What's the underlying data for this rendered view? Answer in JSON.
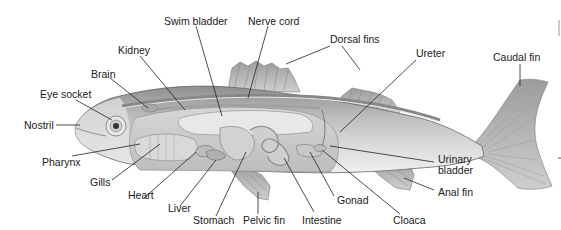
{
  "diagram": {
    "labels": {
      "swim_bladder": "Swim bladder",
      "nerve_cord": "Nerve cord",
      "dorsal_fins": "Dorsal fins",
      "kidney": "Kidney",
      "ureter": "Ureter",
      "caudal_fin": "Caudal fin",
      "brain": "Brain",
      "eye_socket": "Eye socket",
      "nostril": "Nostril",
      "pharynx": "Pharynx",
      "gills": "Gills",
      "heart": "Heart",
      "liver": "Liver",
      "stomach": "Stomach",
      "pelvic_fin": "Pelvic fin",
      "intestine": "Intestine",
      "gonad": "Gonad",
      "cloaca": "Cloaca",
      "urinary_bladder": "Urinary\nbladder",
      "anal_fin": "Anal fin"
    },
    "colors": {
      "background": "#ffffff",
      "text": "#1a1a1a",
      "leader_line": "#222222",
      "body_dark": "#9a9a9a",
      "body_light": "#d8d8d8",
      "organs": "#c4c4c4",
      "fin": "#b5b5b5"
    }
  }
}
